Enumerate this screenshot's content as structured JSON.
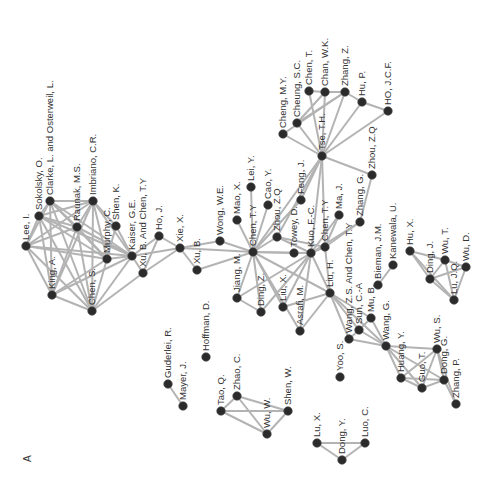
{
  "figure": {
    "panel_label": "A"
  },
  "nodes": [
    {
      "id": "lee_i",
      "label": "Lee, I.",
      "x": 26,
      "y": 246
    },
    {
      "id": "sokolsky",
      "label": "Sokolsky, O.",
      "x": 39,
      "y": 216
    },
    {
      "id": "clarke",
      "label": "Clarke, L. and Osterweil, L.",
      "x": 50,
      "y": 201
    },
    {
      "id": "king",
      "label": "King, A.",
      "x": 52,
      "y": 295
    },
    {
      "id": "raunak",
      "label": "Raunak, M.S.",
      "x": 77,
      "y": 227
    },
    {
      "id": "imbriano",
      "label": "Imbriano, C.R.",
      "x": 93,
      "y": 201
    },
    {
      "id": "chen_s",
      "label": "Chen, S.",
      "x": 92,
      "y": 311
    },
    {
      "id": "murphy",
      "label": "Murphy, C.",
      "x": 107,
      "y": 259
    },
    {
      "id": "shen_k",
      "label": "Shen, K.",
      "x": 116,
      "y": 226
    },
    {
      "id": "kaiser",
      "label": "Kaiser, G.E.",
      "x": 132,
      "y": 256
    },
    {
      "id": "xu_b_chen",
      "label": "Xu, B. And Chen, T.Y",
      "x": 143,
      "y": 273
    },
    {
      "id": "ho_j",
      "label": "Ho, J.",
      "x": 159,
      "y": 236
    },
    {
      "id": "xie_x",
      "label": "Xie, X.",
      "x": 180,
      "y": 248
    },
    {
      "id": "xu_b",
      "label": "Xu, B.",
      "x": 197,
      "y": 270
    },
    {
      "id": "wong_we",
      "label": "Wong, W.E.",
      "x": 220,
      "y": 241
    },
    {
      "id": "mao_x",
      "label": "Mao, X.",
      "x": 237,
      "y": 220
    },
    {
      "id": "lei_y",
      "label": "Lei, Y.",
      "x": 251,
      "y": 187
    },
    {
      "id": "chen_ty",
      "label": "Chen, T.Y",
      "x": 253,
      "y": 252
    },
    {
      "id": "cao_y",
      "label": "Cao, Y.",
      "x": 268,
      "y": 205
    },
    {
      "id": "zhou_zq2",
      "label": "Zhou, Z.Q",
      "x": 277,
      "y": 237
    },
    {
      "id": "jiang_m",
      "label": "Jiang, M.",
      "x": 237,
      "y": 298
    },
    {
      "id": "ding_z",
      "label": "Ding, Z.",
      "x": 261,
      "y": 312
    },
    {
      "id": "liu_x",
      "label": "Liu, X.",
      "x": 283,
      "y": 307
    },
    {
      "id": "feng_j",
      "label": "Feng, J.",
      "x": 301,
      "y": 200
    },
    {
      "id": "towey",
      "label": "Towey, D.",
      "x": 294,
      "y": 253
    },
    {
      "id": "kuo",
      "label": "Kuo, F.-C.",
      "x": 311,
      "y": 253
    },
    {
      "id": "chen_ty2",
      "label": "Chen, T.Y",
      "x": 325,
      "y": 247
    },
    {
      "id": "ma_j",
      "label": "Ma, J.",
      "x": 339,
      "y": 215
    },
    {
      "id": "asrafi",
      "label": "Asrafi, M.",
      "x": 300,
      "y": 331
    },
    {
      "id": "liu_h",
      "label": "Liu, H.",
      "x": 330,
      "y": 293
    },
    {
      "id": "tse",
      "label": "Tse, T.H.",
      "x": 322,
      "y": 156
    },
    {
      "id": "zhang_g",
      "label": "Zhang, G.",
      "x": 360,
      "y": 222
    },
    {
      "id": "zhou_zq",
      "label": "Zhou, Z.Q",
      "x": 372,
      "y": 175
    },
    {
      "id": "cheng_my",
      "label": "Cheng, M.Y.",
      "x": 283,
      "y": 134
    },
    {
      "id": "cheung",
      "label": "Cheung, S.C.",
      "x": 297,
      "y": 123
    },
    {
      "id": "chen_t",
      "label": "Chen, T.",
      "x": 309,
      "y": 91
    },
    {
      "id": "chan_wk",
      "label": "Chan, W.K.",
      "x": 325,
      "y": 92
    },
    {
      "id": "zhang_z",
      "label": "Zhang, Z.",
      "x": 345,
      "y": 92
    },
    {
      "id": "hu_p",
      "label": "Hu, P.",
      "x": 362,
      "y": 102
    },
    {
      "id": "ho_jcf",
      "label": "HO, J.C.F.",
      "x": 388,
      "y": 111
    },
    {
      "id": "bieman",
      "label": "Bieman, J.M.",
      "x": 378,
      "y": 285
    },
    {
      "id": "kanewala",
      "label": "Kanewala, U.",
      "x": 393,
      "y": 265
    },
    {
      "id": "wang_zs",
      "label": "Wang, Z.S. And Chen, T.Y",
      "x": 349,
      "y": 339
    },
    {
      "id": "sun_ca",
      "label": "Sun, C.-A",
      "x": 359,
      "y": 330
    },
    {
      "id": "mu_b",
      "label": "Mu, B.",
      "x": 371,
      "y": 318
    },
    {
      "id": "wang_g",
      "label": "Wang, G.",
      "x": 386,
      "y": 346
    },
    {
      "id": "yoo_s",
      "label": "Yoo, S.",
      "x": 340,
      "y": 377
    },
    {
      "id": "huang_y",
      "label": "Huang, Y.",
      "x": 401,
      "y": 378
    },
    {
      "id": "wu_s",
      "label": "Wu, S.",
      "x": 437,
      "y": 349
    },
    {
      "id": "guo_t",
      "label": "Guo, T.",
      "x": 422,
      "y": 388
    },
    {
      "id": "dong_g",
      "label": "Dong, G.",
      "x": 444,
      "y": 380
    },
    {
      "id": "zhang_p",
      "label": "Zhang, P.",
      "x": 456,
      "y": 404
    },
    {
      "id": "hu_x",
      "label": "Hu, X.",
      "x": 410,
      "y": 251
    },
    {
      "id": "ding_j",
      "label": "Ding, J.",
      "x": 430,
      "y": 279
    },
    {
      "id": "wu_t",
      "label": "Wu, T.",
      "x": 445,
      "y": 260
    },
    {
      "id": "wu_d",
      "label": "Wu, D.",
      "x": 466,
      "y": 267
    },
    {
      "id": "lu_jq",
      "label": "Lu, J.Q.",
      "x": 454,
      "y": 300
    },
    {
      "id": "guderlei",
      "label": "Guderlei, R.",
      "x": 168,
      "y": 384
    },
    {
      "id": "mayer",
      "label": "Mayer, J.",
      "x": 183,
      "y": 406
    },
    {
      "id": "hoffman",
      "label": "Hoffman, D.",
      "x": 206,
      "y": 357
    },
    {
      "id": "tao_q",
      "label": "Tao, Q.",
      "x": 221,
      "y": 411
    },
    {
      "id": "zhao_c",
      "label": "Zhao, C.",
      "x": 237,
      "y": 396
    },
    {
      "id": "shen_w",
      "label": "Shen, W.",
      "x": 288,
      "y": 411
    },
    {
      "id": "wu_w",
      "label": "Wu, W.",
      "x": 267,
      "y": 434
    },
    {
      "id": "lu_x",
      "label": "Lu, X.",
      "x": 317,
      "y": 443
    },
    {
      "id": "dong_y",
      "label": "Dong, Y.",
      "x": 342,
      "y": 460
    },
    {
      "id": "luo_c",
      "label": "Luo, C.",
      "x": 365,
      "y": 443
    }
  ],
  "edges": [
    [
      "lee_i",
      "sokolsky"
    ],
    [
      "lee_i",
      "clarke"
    ],
    [
      "lee_i",
      "king"
    ],
    [
      "lee_i",
      "raunak"
    ],
    [
      "lee_i",
      "imbriano"
    ],
    [
      "lee_i",
      "chen_s"
    ],
    [
      "lee_i",
      "murphy"
    ],
    [
      "lee_i",
      "kaiser"
    ],
    [
      "sokolsky",
      "clarke"
    ],
    [
      "sokolsky",
      "king"
    ],
    [
      "sokolsky",
      "raunak"
    ],
    [
      "sokolsky",
      "imbriano"
    ],
    [
      "sokolsky",
      "chen_s"
    ],
    [
      "sokolsky",
      "murphy"
    ],
    [
      "sokolsky",
      "kaiser"
    ],
    [
      "clarke",
      "imbriano"
    ],
    [
      "clarke",
      "raunak"
    ],
    [
      "clarke",
      "king"
    ],
    [
      "clarke",
      "murphy"
    ],
    [
      "clarke",
      "kaiser"
    ],
    [
      "clarke",
      "chen_s"
    ],
    [
      "raunak",
      "imbriano"
    ],
    [
      "raunak",
      "king"
    ],
    [
      "raunak",
      "murphy"
    ],
    [
      "raunak",
      "kaiser"
    ],
    [
      "raunak",
      "chen_s"
    ],
    [
      "imbriano",
      "king"
    ],
    [
      "imbriano",
      "murphy"
    ],
    [
      "imbriano",
      "kaiser"
    ],
    [
      "imbriano",
      "chen_s"
    ],
    [
      "imbriano",
      "shen_k"
    ],
    [
      "king",
      "murphy"
    ],
    [
      "king",
      "kaiser"
    ],
    [
      "king",
      "chen_s"
    ],
    [
      "chen_s",
      "murphy"
    ],
    [
      "chen_s",
      "kaiser"
    ],
    [
      "chen_s",
      "xu_b_chen"
    ],
    [
      "murphy",
      "kaiser"
    ],
    [
      "murphy",
      "shen_k"
    ],
    [
      "shen_k",
      "kaiser"
    ],
    [
      "kaiser",
      "xu_b_chen"
    ],
    [
      "kaiser",
      "ho_j"
    ],
    [
      "kaiser",
      "xie_x"
    ],
    [
      "xu_b_chen",
      "ho_j"
    ],
    [
      "xu_b_chen",
      "xie_x"
    ],
    [
      "ho_j",
      "xie_x"
    ],
    [
      "xie_x",
      "xu_b"
    ],
    [
      "xie_x",
      "wong_we"
    ],
    [
      "xie_x",
      "chen_ty"
    ],
    [
      "xu_b",
      "chen_ty"
    ],
    [
      "wong_we",
      "chen_ty"
    ],
    [
      "mao_x",
      "chen_ty"
    ],
    [
      "lei_y",
      "chen_ty"
    ],
    [
      "cao_y",
      "chen_ty"
    ],
    [
      "zhou_zq2",
      "chen_ty"
    ],
    [
      "chen_ty",
      "jiang_m"
    ],
    [
      "chen_ty",
      "ding_z"
    ],
    [
      "chen_ty",
      "liu_x"
    ],
    [
      "chen_ty",
      "towey"
    ],
    [
      "chen_ty",
      "kuo"
    ],
    [
      "chen_ty",
      "liu_h"
    ],
    [
      "chen_ty",
      "tse"
    ],
    [
      "chen_ty",
      "feng_j"
    ],
    [
      "chen_ty",
      "asrafi"
    ],
    [
      "jiang_m",
      "ding_z"
    ],
    [
      "jiang_m",
      "kuo"
    ],
    [
      "ding_z",
      "kuo"
    ],
    [
      "liu_x",
      "kuo"
    ],
    [
      "liu_x",
      "liu_h"
    ],
    [
      "asrafi",
      "liu_h"
    ],
    [
      "asrafi",
      "kuo"
    ],
    [
      "zhou_zq2",
      "tse"
    ],
    [
      "zhou_zq2",
      "kuo"
    ],
    [
      "zhou_zq2",
      "chen_ty2"
    ],
    [
      "feng_j",
      "tse"
    ],
    [
      "towey",
      "kuo"
    ],
    [
      "kuo",
      "chen_ty2"
    ],
    [
      "kuo",
      "tse"
    ],
    [
      "kuo",
      "liu_h"
    ],
    [
      "kuo",
      "ma_j"
    ],
    [
      "kuo",
      "zhang_g"
    ],
    [
      "chen_ty2",
      "tse"
    ],
    [
      "chen_ty2",
      "ma_j"
    ],
    [
      "chen_ty2",
      "zhang_g"
    ],
    [
      "chen_ty2",
      "liu_h"
    ],
    [
      "zhang_g",
      "zhou_zq"
    ],
    [
      "tse",
      "zhou_zq"
    ],
    [
      "tse",
      "cheng_my"
    ],
    [
      "tse",
      "cheung"
    ],
    [
      "tse",
      "chen_t"
    ],
    [
      "tse",
      "chan_wk"
    ],
    [
      "tse",
      "zhang_z"
    ],
    [
      "tse",
      "hu_p"
    ],
    [
      "tse",
      "ho_jcf"
    ],
    [
      "cheng_my",
      "zhang_z"
    ],
    [
      "cheung",
      "chan_wk"
    ],
    [
      "cheung",
      "zhang_z"
    ],
    [
      "chen_t",
      "chan_wk"
    ],
    [
      "chan_wk",
      "zhang_z"
    ],
    [
      "zhang_z",
      "hu_p"
    ],
    [
      "hu_p",
      "ho_jcf"
    ],
    [
      "liu_h",
      "wang_zs"
    ],
    [
      "liu_h",
      "sun_ca"
    ],
    [
      "liu_h",
      "mu_b"
    ],
    [
      "liu_h",
      "wang_g"
    ],
    [
      "wang_zs",
      "sun_ca"
    ],
    [
      "wang_zs",
      "wang_g"
    ],
    [
      "sun_ca",
      "wang_g"
    ],
    [
      "mu_b",
      "wang_g"
    ],
    [
      "sun_ca",
      "mu_b"
    ],
    [
      "bieman",
      "kanewala"
    ],
    [
      "wang_g",
      "huang_y"
    ],
    [
      "wang_g",
      "wu_s"
    ],
    [
      "wang_g",
      "guo_t"
    ],
    [
      "wang_g",
      "dong_g"
    ],
    [
      "huang_y",
      "guo_t"
    ],
    [
      "huang_y",
      "dong_g"
    ],
    [
      "huang_y",
      "wu_s"
    ],
    [
      "guo_t",
      "dong_g"
    ],
    [
      "guo_t",
      "wu_s"
    ],
    [
      "dong_g",
      "wu_s"
    ],
    [
      "dong_g",
      "zhang_p"
    ],
    [
      "wu_s",
      "zhang_p"
    ],
    [
      "hu_x",
      "ding_j"
    ],
    [
      "hu_x",
      "wu_t"
    ],
    [
      "hu_x",
      "lu_jq"
    ],
    [
      "ding_j",
      "wu_t"
    ],
    [
      "ding_j",
      "wu_d"
    ],
    [
      "ding_j",
      "lu_jq"
    ],
    [
      "wu_t",
      "wu_d"
    ],
    [
      "wu_t",
      "lu_jq"
    ],
    [
      "wu_d",
      "lu_jq"
    ],
    [
      "guderlei",
      "mayer"
    ],
    [
      "tao_q",
      "zhao_c"
    ],
    [
      "tao_q",
      "shen_w"
    ],
    [
      "tao_q",
      "wu_w"
    ],
    [
      "zhao_c",
      "shen_w"
    ],
    [
      "zhao_c",
      "wu_w"
    ],
    [
      "shen_w",
      "wu_w"
    ],
    [
      "lu_x",
      "dong_y"
    ],
    [
      "lu_x",
      "luo_c"
    ],
    [
      "dong_y",
      "luo_c"
    ]
  ]
}
